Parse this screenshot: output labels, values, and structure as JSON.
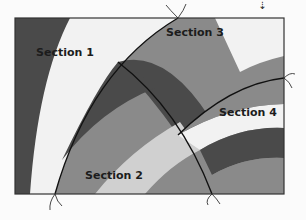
{
  "diagram": {
    "type": "quilt-block-sections",
    "sections": [
      {
        "id": 1,
        "label": "Section 1"
      },
      {
        "id": 2,
        "label": "Section 2"
      },
      {
        "id": 3,
        "label": "Section 3"
      },
      {
        "id": 4,
        "label": "Section 4"
      }
    ],
    "top_indicator": {
      "icon": "down-arrow-icon",
      "glyph": "⇣"
    },
    "colors": {
      "background": "#fbfbfb",
      "darkest": "#4a4a4a",
      "dark": "#5c5c5c",
      "medium": "#8a8a8a",
      "medium_light": "#a5a5a5",
      "light": "#d0d0d0",
      "lightest": "#f2f2f2",
      "seam": "#111111",
      "frame": "#333333"
    }
  }
}
